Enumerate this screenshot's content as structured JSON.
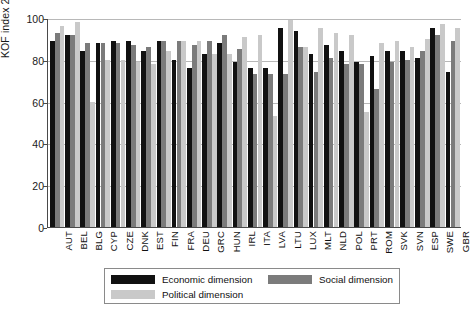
{
  "chart_data": {
    "type": "bar",
    "title": "",
    "xlabel": "",
    "ylabel": "KOF index 2007",
    "ylim": [
      0,
      100
    ],
    "yticks": [
      0,
      20,
      40,
      60,
      80,
      100
    ],
    "grid": true,
    "legend_position": "bottom",
    "categories": [
      "AUT",
      "BEL",
      "BLG",
      "CYP",
      "CZE",
      "DNK",
      "EST",
      "FIN",
      "FRA",
      "DEU",
      "GRC",
      "HUN",
      "IRL",
      "ITA",
      "LVA",
      "LTU",
      "LUX",
      "MLT",
      "NLD",
      "POL",
      "PRT",
      "ROM",
      "SVK",
      "SVN",
      "ESP",
      "SWE",
      "GBR"
    ],
    "series": [
      {
        "name": "Economic dimension",
        "color": "#111111",
        "values": [
          89,
          92,
          84,
          88,
          89,
          89,
          84,
          89,
          80,
          76,
          83,
          88,
          79,
          76,
          76,
          95,
          94,
          83,
          87,
          84,
          79,
          82,
          84,
          84,
          81,
          95,
          74
        ]
      },
      {
        "name": "Social dimension",
        "color": "#7b7b7b",
        "values": [
          93,
          92,
          88,
          88,
          88,
          87,
          86,
          89,
          89,
          87,
          89,
          92,
          85,
          73,
          73,
          73,
          86,
          74,
          81,
          78,
          78,
          66,
          79,
          80,
          84,
          92,
          89
        ]
      },
      {
        "name": "Political dimension",
        "color": "#c9c9c9",
        "values": [
          96,
          98,
          60,
          80,
          80,
          79,
          78,
          84,
          89,
          89,
          83,
          83,
          91,
          92,
          53,
          99,
          86,
          95,
          93,
          92,
          55,
          88,
          89,
          86,
          90,
          97,
          95
        ]
      }
    ]
  },
  "legend": {
    "entries": [
      {
        "label": "Economic dimension",
        "swatch": "eco"
      },
      {
        "label": "Social dimension",
        "swatch": "soc"
      },
      {
        "label": "Political dimension",
        "swatch": "pol"
      }
    ]
  }
}
